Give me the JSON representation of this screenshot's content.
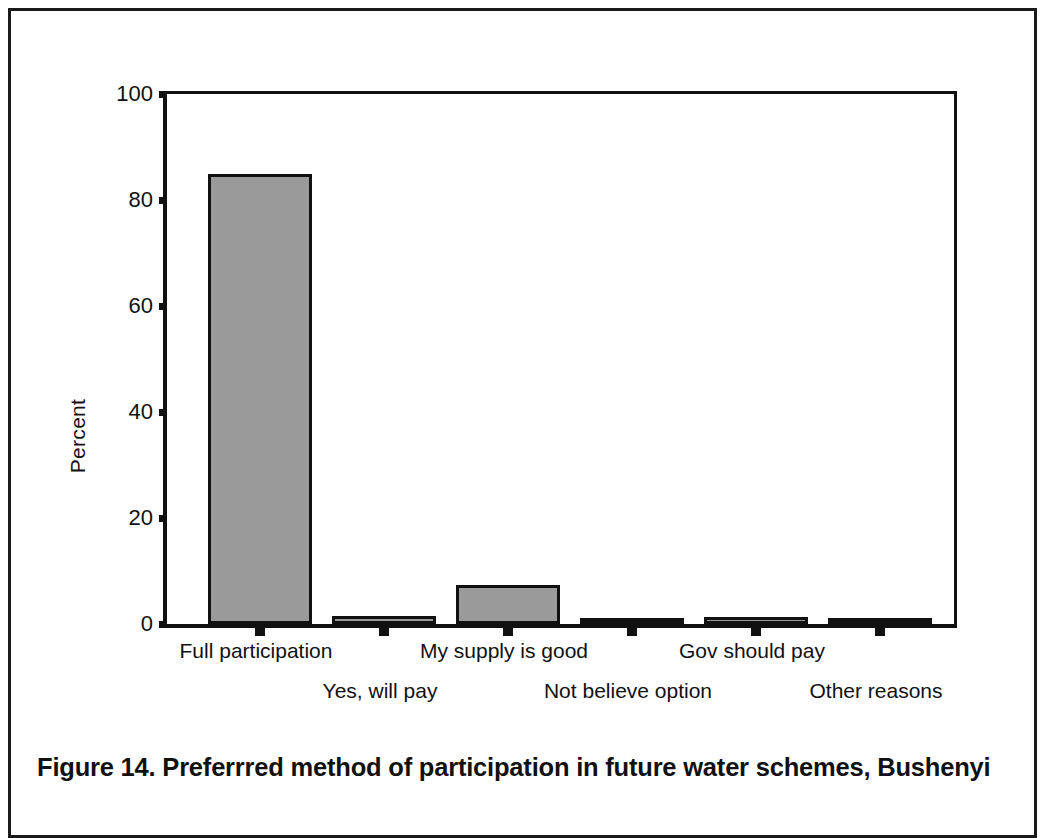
{
  "figure": {
    "caption": "Figure 14. Preferrred method of participation in future water schemes, Bushenyi"
  },
  "chart_data": {
    "type": "bar",
    "title": "",
    "xlabel": "",
    "ylabel": "Percent",
    "ylim": [
      0,
      100
    ],
    "yticks": [
      0,
      20,
      40,
      60,
      80,
      100
    ],
    "grid": false,
    "legend": null,
    "bar_color": "#9a9a9a",
    "bar_edge_color": "#111111",
    "categories": [
      "Full participation",
      "Yes, will pay",
      "My supply is good",
      "Not believe option",
      "Gov should pay",
      "Other reasons"
    ],
    "values": [
      85,
      1.5,
      7.3,
      0.7,
      1.3,
      0.7
    ]
  }
}
